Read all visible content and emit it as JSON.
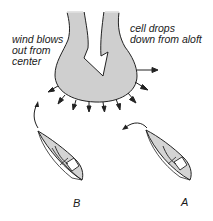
{
  "diagram": {
    "type": "sailing wind diagram",
    "colors": {
      "cloud_fill": "#cfcfcf",
      "boat_fill": "#d4d4d4",
      "stroke": "#222222",
      "background": "#ffffff"
    },
    "labels": {
      "wind_line1": "wind blows",
      "wind_line2": "out from",
      "wind_line3": "center",
      "cell_line1": "cell drops",
      "cell_line2": "down from aloft",
      "boat_b": "B",
      "boat_a": "A"
    },
    "elements": {
      "cloud_cell": "downdraft cell shape with downward arrow",
      "outflow_arrows": 10,
      "boats": [
        "B",
        "A"
      ]
    }
  }
}
